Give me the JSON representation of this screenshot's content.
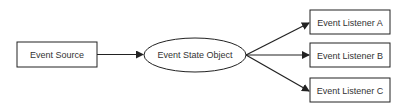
{
  "diagram": {
    "type": "flow",
    "nodes": [
      {
        "id": "source",
        "label": "Event Source",
        "shape": "rectangle"
      },
      {
        "id": "state",
        "label": "Event State Object",
        "shape": "ellipse"
      },
      {
        "id": "listenerA",
        "label": "Event Listener A",
        "shape": "rectangle"
      },
      {
        "id": "listenerB",
        "label": "Event Listener B",
        "shape": "rectangle"
      },
      {
        "id": "listenerC",
        "label": "Event Listener C",
        "shape": "rectangle"
      }
    ],
    "edges": [
      {
        "from": "source",
        "to": "state"
      },
      {
        "from": "state",
        "to": "listenerA"
      },
      {
        "from": "state",
        "to": "listenerB"
      },
      {
        "from": "state",
        "to": "listenerC"
      }
    ],
    "colors": {
      "stroke": "#222222",
      "text": "#333333",
      "background": "#ffffff"
    }
  }
}
